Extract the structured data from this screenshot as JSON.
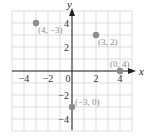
{
  "chart_data": {
    "type": "scatter",
    "title": "",
    "xlabel": "x",
    "ylabel": "y",
    "xlim": [
      -5,
      5
    ],
    "ylim": [
      -5,
      5
    ],
    "grid": true,
    "x_ticks": [
      -4,
      -2,
      0,
      2,
      4
    ],
    "x_tick_labels": [
      "−4",
      "−2",
      "0",
      "2",
      "4"
    ],
    "y_ticks": [
      4,
      2,
      -2,
      -4
    ],
    "y_tick_labels": [
      "4",
      "2",
      "−2",
      "−4"
    ],
    "points": [
      {
        "x": -3,
        "y": 4,
        "label": "(4, −3)"
      },
      {
        "x": 2,
        "y": 3,
        "label": "(3, 2)"
      },
      {
        "x": 4,
        "y": 0,
        "label": "(0, 4)"
      },
      {
        "x": 0,
        "y": -3,
        "label": "(−3, 0)"
      }
    ]
  },
  "colors": {
    "grid": "#c8c8c8",
    "axis": "#222222",
    "point": "#8c8c8c",
    "point_label": "#8a8a8a",
    "tick_label": "#333333"
  }
}
